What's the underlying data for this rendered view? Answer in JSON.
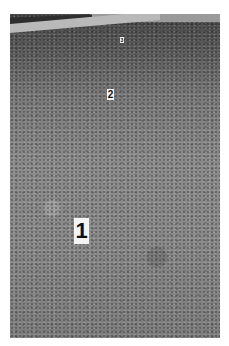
{
  "photo": {
    "description": "Black-and-white photograph of a flat, sparsely vegetated ground surface receding toward a road at the top-left, with numbered marker cards placed on the ground",
    "markers": [
      {
        "label": "1",
        "position": "foreground"
      },
      {
        "label": "2",
        "position": "midground"
      },
      {
        "label": "3",
        "position": "background"
      }
    ]
  }
}
